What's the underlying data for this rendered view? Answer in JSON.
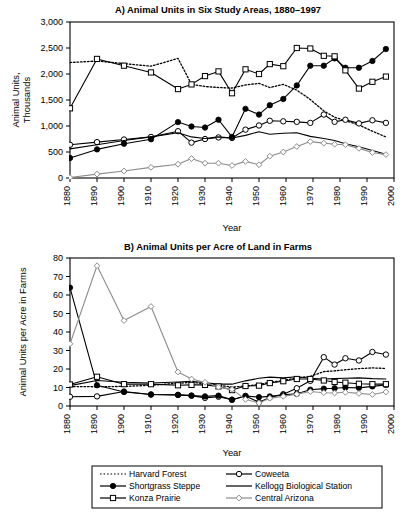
{
  "figure": {
    "xlabel": "Year",
    "x_ticks": [
      1880,
      1890,
      1900,
      1910,
      1920,
      1930,
      1940,
      1950,
      1960,
      1970,
      1980,
      1990,
      2000
    ]
  },
  "legend": {
    "items": [
      {
        "label": "Harvard Forest",
        "style": "dotted",
        "marker": "none",
        "color": "#000000"
      },
      {
        "label": "Coweeta",
        "style": "solid",
        "marker": "open-circle",
        "color": "#000000"
      },
      {
        "label": "Shortgrass Steppe",
        "style": "solid",
        "marker": "filled-circle",
        "color": "#000000"
      },
      {
        "label": "Kellogg Biological Station",
        "style": "solid",
        "marker": "none",
        "color": "#000000"
      },
      {
        "label": "Konza Prairie",
        "style": "solid",
        "marker": "open-square",
        "color": "#000000"
      },
      {
        "label": "Central Arizona",
        "style": "solid",
        "marker": "open-diamond",
        "color": "#8c8c8c"
      }
    ],
    "order": [
      0,
      1,
      2,
      3,
      4,
      5
    ]
  },
  "chart_data": [
    {
      "id": "panelA",
      "type": "line",
      "title": "A)  Animal Units in Six Study Areas, 1880–1997",
      "xlabel": "Year",
      "ylabel": "Animal Units,\nThousands",
      "ylabel_lines": [
        "Animal Units,",
        "Thousands"
      ],
      "xlim": [
        1880,
        2000
      ],
      "ylim": [
        0,
        3000
      ],
      "y_ticks": [
        0,
        500,
        1000,
        1500,
        2000,
        2500,
        3000
      ],
      "y_tick_labels": [
        "0",
        "500",
        "1,000",
        "1,500",
        "2,000",
        "2,500",
        "3,000"
      ],
      "x_ticks": [
        1880,
        1890,
        1900,
        1910,
        1920,
        1930,
        1940,
        1950,
        1960,
        1970,
        1980,
        1990,
        2000
      ],
      "grid": false,
      "legend_position": "below-figure",
      "series": [
        {
          "name": "Harvard Forest",
          "style": "dotted",
          "marker": "none",
          "color": "#000000",
          "x": [
            1880,
            1890,
            1900,
            1910,
            1920,
            1925,
            1930,
            1935,
            1940,
            1945,
            1950,
            1954,
            1959,
            1964,
            1969,
            1974,
            1978,
            1982,
            1987,
            1992,
            1997
          ],
          "y": [
            2220,
            2250,
            2200,
            2150,
            2300,
            1800,
            1760,
            1740,
            1730,
            1790,
            1820,
            1740,
            1800,
            1690,
            1510,
            1290,
            1170,
            1100,
            1020,
            900,
            790
          ]
        },
        {
          "name": "Coweeta",
          "style": "solid",
          "marker": "open-circle",
          "color": "#000000",
          "x": [
            1880,
            1890,
            1900,
            1910,
            1920,
            1925,
            1930,
            1935,
            1940,
            1945,
            1950,
            1954,
            1959,
            1964,
            1969,
            1974,
            1978,
            1982,
            1987,
            1992,
            1997
          ],
          "y": [
            640,
            690,
            740,
            790,
            900,
            680,
            750,
            780,
            770,
            930,
            1010,
            1100,
            1090,
            1080,
            1060,
            1220,
            1080,
            1120,
            1050,
            1110,
            1060
          ]
        },
        {
          "name": "Shortgrass Steppe",
          "style": "solid",
          "marker": "filled-circle",
          "color": "#000000",
          "x": [
            1880,
            1890,
            1900,
            1910,
            1920,
            1925,
            1930,
            1935,
            1940,
            1945,
            1950,
            1954,
            1959,
            1964,
            1969,
            1974,
            1978,
            1982,
            1987,
            1992,
            1997
          ],
          "y": [
            385,
            550,
            660,
            745,
            1075,
            990,
            970,
            1120,
            790,
            1330,
            1220,
            1400,
            1520,
            1780,
            2160,
            2160,
            2300,
            2120,
            2120,
            2250,
            2480
          ]
        },
        {
          "name": "Kellogg Biological Station",
          "style": "solid",
          "marker": "none",
          "color": "#000000",
          "x": [
            1880,
            1890,
            1900,
            1910,
            1920,
            1925,
            1930,
            1935,
            1940,
            1945,
            1950,
            1954,
            1959,
            1964,
            1969,
            1974,
            1978,
            1982,
            1987,
            1992,
            1997
          ],
          "y": [
            560,
            640,
            720,
            790,
            870,
            790,
            760,
            790,
            770,
            820,
            890,
            840,
            860,
            870,
            800,
            760,
            720,
            660,
            600,
            530,
            455
          ]
        },
        {
          "name": "Konza Prairie",
          "style": "solid",
          "marker": "open-square",
          "color": "#000000",
          "x": [
            1880,
            1890,
            1900,
            1910,
            1920,
            1925,
            1930,
            1935,
            1940,
            1945,
            1950,
            1954,
            1959,
            1964,
            1969,
            1974,
            1978,
            1982,
            1987,
            1992,
            1997
          ],
          "y": [
            1340,
            2290,
            2160,
            2030,
            1710,
            1800,
            1960,
            2050,
            1630,
            2090,
            2000,
            2190,
            2150,
            2500,
            2490,
            2350,
            2340,
            2070,
            1720,
            1850,
            1950
          ]
        },
        {
          "name": "Central Arizona",
          "style": "solid",
          "marker": "open-diamond",
          "color": "#8c8c8c",
          "x": [
            1880,
            1890,
            1900,
            1910,
            1920,
            1925,
            1930,
            1935,
            1940,
            1945,
            1950,
            1954,
            1959,
            1964,
            1969,
            1974,
            1978,
            1982,
            1987,
            1992,
            1997
          ],
          "y": [
            10,
            75,
            135,
            205,
            265,
            375,
            285,
            285,
            240,
            320,
            255,
            420,
            500,
            605,
            700,
            670,
            650,
            640,
            570,
            490,
            450
          ]
        }
      ]
    },
    {
      "id": "panelB",
      "type": "line",
      "title": "B)  Animal Units per Acre of Land in Farms",
      "xlabel": "Year",
      "ylabel": "Animal Units per Acre in Farms",
      "xlim": [
        1880,
        2000
      ],
      "ylim": [
        0,
        80
      ],
      "y_ticks": [
        0,
        10,
        20,
        30,
        40,
        50,
        60,
        70,
        80
      ],
      "y_tick_labels": [
        "0",
        "10",
        "20",
        "30",
        "40",
        "50",
        "60",
        "70",
        "80"
      ],
      "x_ticks": [
        1880,
        1890,
        1900,
        1910,
        1920,
        1930,
        1940,
        1950,
        1960,
        1970,
        1980,
        1990,
        2000
      ],
      "grid": false,
      "legend_position": "below-figure",
      "series": [
        {
          "name": "Harvard Forest",
          "style": "dotted",
          "marker": "none",
          "color": "#000000",
          "x": [
            1880,
            1890,
            1900,
            1910,
            1920,
            1925,
            1930,
            1935,
            1940,
            1945,
            1950,
            1954,
            1959,
            1964,
            1969,
            1974,
            1978,
            1982,
            1987,
            1992,
            1997
          ],
          "y": [
            10.5,
            10.4,
            10.6,
            11.2,
            12.3,
            12.8,
            12.0,
            11.2,
            10.2,
            10.8,
            11.6,
            12.8,
            13.8,
            15.2,
            16.0,
            18.6,
            19.0,
            19.6,
            20.2,
            20.6,
            20.3
          ]
        },
        {
          "name": "Coweeta",
          "style": "solid",
          "marker": "open-circle",
          "color": "#000000",
          "x": [
            1880,
            1890,
            1900,
            1910,
            1920,
            1925,
            1930,
            1935,
            1940,
            1945,
            1950,
            1954,
            1959,
            1964,
            1969,
            1974,
            1978,
            1982,
            1987,
            1992,
            1997
          ],
          "y": [
            5.0,
            5.2,
            7.8,
            6.2,
            6.0,
            5.6,
            4.4,
            5.0,
            3.4,
            5.4,
            2.0,
            4.6,
            6.4,
            9.6,
            13.6,
            26.4,
            22.4,
            25.8,
            24.6,
            29.2,
            27.8
          ]
        },
        {
          "name": "Shortgrass Steppe",
          "style": "solid",
          "marker": "filled-circle",
          "color": "#000000",
          "x": [
            1880,
            1890,
            1900,
            1910,
            1920,
            1925,
            1930,
            1935,
            1940,
            1945,
            1950,
            1954,
            1959,
            1964,
            1969,
            1974,
            1978,
            1982,
            1987,
            1992,
            1997
          ],
          "y": [
            64.0,
            11.2,
            7.6,
            6.2,
            6.0,
            5.6,
            5.2,
            5.6,
            3.4,
            5.4,
            4.8,
            5.2,
            6.0,
            6.6,
            8.8,
            9.4,
            9.6,
            10.0,
            9.8,
            10.6,
            11.4
          ]
        },
        {
          "name": "Kellogg Biological Station",
          "style": "solid",
          "marker": "none",
          "color": "#000000",
          "x": [
            1880,
            1890,
            1900,
            1910,
            1920,
            1925,
            1930,
            1935,
            1940,
            1945,
            1950,
            1954,
            1959,
            1964,
            1969,
            1974,
            1978,
            1982,
            1987,
            1992,
            1997
          ],
          "y": [
            11.0,
            13.8,
            12.8,
            12.4,
            13.0,
            13.4,
            12.6,
            11.8,
            11.8,
            13.6,
            15.0,
            15.6,
            15.2,
            15.8,
            15.0,
            14.6,
            14.8,
            15.0,
            15.2,
            14.8,
            14.6
          ]
        },
        {
          "name": "Konza Prairie",
          "style": "solid",
          "marker": "open-square",
          "color": "#000000",
          "x": [
            1880,
            1890,
            1900,
            1910,
            1920,
            1925,
            1930,
            1935,
            1940,
            1945,
            1950,
            1954,
            1959,
            1964,
            1969,
            1974,
            1978,
            1982,
            1987,
            1992,
            1997
          ],
          "y": [
            11.6,
            15.8,
            11.8,
            11.8,
            11.2,
            11.4,
            11.4,
            10.6,
            8.6,
            10.8,
            11.0,
            12.4,
            13.4,
            14.6,
            14.6,
            13.8,
            13.0,
            12.6,
            12.0,
            11.8,
            11.8
          ]
        },
        {
          "name": "Central Arizona",
          "style": "solid",
          "marker": "open-diamond",
          "color": "#8c8c8c",
          "x": [
            1880,
            1890,
            1900,
            1910,
            1920,
            1925,
            1930,
            1935,
            1940,
            1945,
            1950,
            1954,
            1959,
            1964,
            1969,
            1974,
            1978,
            1982,
            1987,
            1992,
            1997
          ],
          "y": [
            33.6,
            75.8,
            46.2,
            53.8,
            18.4,
            14.6,
            12.8,
            10.2,
            9.0,
            3.6,
            1.6,
            4.2,
            5.2,
            6.4,
            7.8,
            7.2,
            7.0,
            7.4,
            6.8,
            6.2,
            7.6
          ]
        }
      ]
    }
  ]
}
